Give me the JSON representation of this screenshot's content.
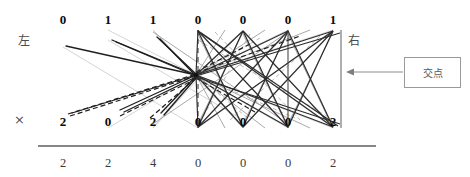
{
  "labels": {
    "left": "左",
    "right": "右",
    "multiply": "×",
    "callout": "交点"
  },
  "columns": {
    "x": [
      63,
      108,
      153,
      198,
      243,
      288,
      333
    ],
    "y_top": 20,
    "y_mid": 122,
    "y_sum": 163
  },
  "rows": {
    "top": {
      "name": "multiplicand-row",
      "values": [
        "0",
        "1",
        "1",
        "0",
        "0",
        "0",
        "1"
      ]
    },
    "middle": {
      "name": "multiplier-row",
      "values": [
        "2",
        "0",
        "2",
        "0",
        "0",
        "0",
        "2"
      ]
    },
    "sum": {
      "name": "product-row",
      "values": [
        "2",
        "2",
        "4",
        "0",
        "0",
        "0",
        "2"
      ]
    }
  },
  "geometry": {
    "node": {
      "x": 196,
      "y": 75,
      "label": "intersection-node"
    },
    "rule": {
      "x1": 38,
      "x2": 376,
      "y": 146
    },
    "right_axis": {
      "x": 341,
      "y1": 30,
      "y2": 128
    },
    "dashed_axis": {
      "x": 198,
      "y1": 30,
      "y2": 128
    },
    "solid_axis": {
      "x": 288,
      "y1": 30,
      "y2": 128
    },
    "arrow": {
      "from_x": 404,
      "to_x": 346,
      "y": 72
    },
    "callout_box": {
      "x": 404,
      "y": 57,
      "w": 57,
      "h": 31
    }
  },
  "colors": {
    "ink": "#1a1a1a",
    "mid": "#5a5a5a",
    "faint": "#bdbdbd",
    "rule": "#5f5f5f",
    "box_border": "#9a9a9a"
  }
}
